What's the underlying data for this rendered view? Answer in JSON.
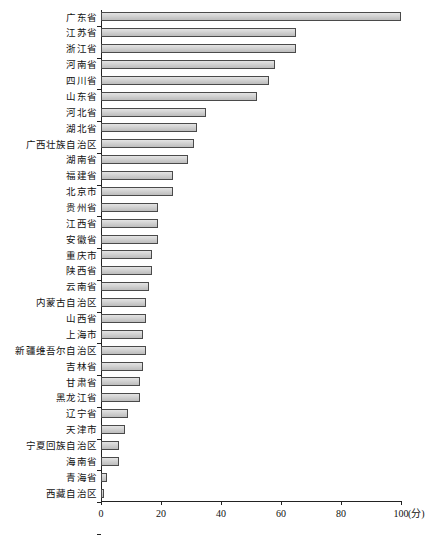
{
  "chart_data": {
    "type": "bar",
    "orientation": "horizontal",
    "title": "",
    "subtitle": "",
    "xlabel": "(分)",
    "ylabel": "",
    "xlim": [
      0,
      100
    ],
    "ylim": null,
    "grid": false,
    "legend": null,
    "xticks": [
      0,
      20,
      40,
      60,
      80,
      100
    ],
    "xtick_labels": [
      "0",
      "20",
      "40",
      "60",
      "80",
      "100"
    ],
    "unit_label": "(分)",
    "bar_fill_color": "#d2d2d2",
    "bar_border_color": "#4a4a4a",
    "axis_color": "#222222",
    "categories": [
      "广东省",
      "江苏省",
      "浙江省",
      "河南省",
      "四川省",
      "山东省",
      "河北省",
      "湖北省",
      "广西壮族自治区",
      "湖南省",
      "福建省",
      "北京市",
      "贵州省",
      "江西省",
      "安徽省",
      "重庆市",
      "陕西省",
      "云南省",
      "内蒙古自治区",
      "山西省",
      "上海市",
      "新疆维吾尔自治区",
      "吉林省",
      "甘肃省",
      "黑龙江省",
      "辽宁省",
      "天津市",
      "宁夏回族自治区",
      "海南省",
      "青海省",
      "西藏自治区"
    ],
    "values": [
      100,
      65,
      65,
      58,
      56,
      52,
      35,
      32,
      31,
      29,
      24,
      24,
      19,
      19,
      19,
      17,
      17,
      16,
      15,
      15,
      14,
      15,
      14,
      13,
      13,
      9,
      8,
      6,
      6,
      2,
      1
    ]
  }
}
